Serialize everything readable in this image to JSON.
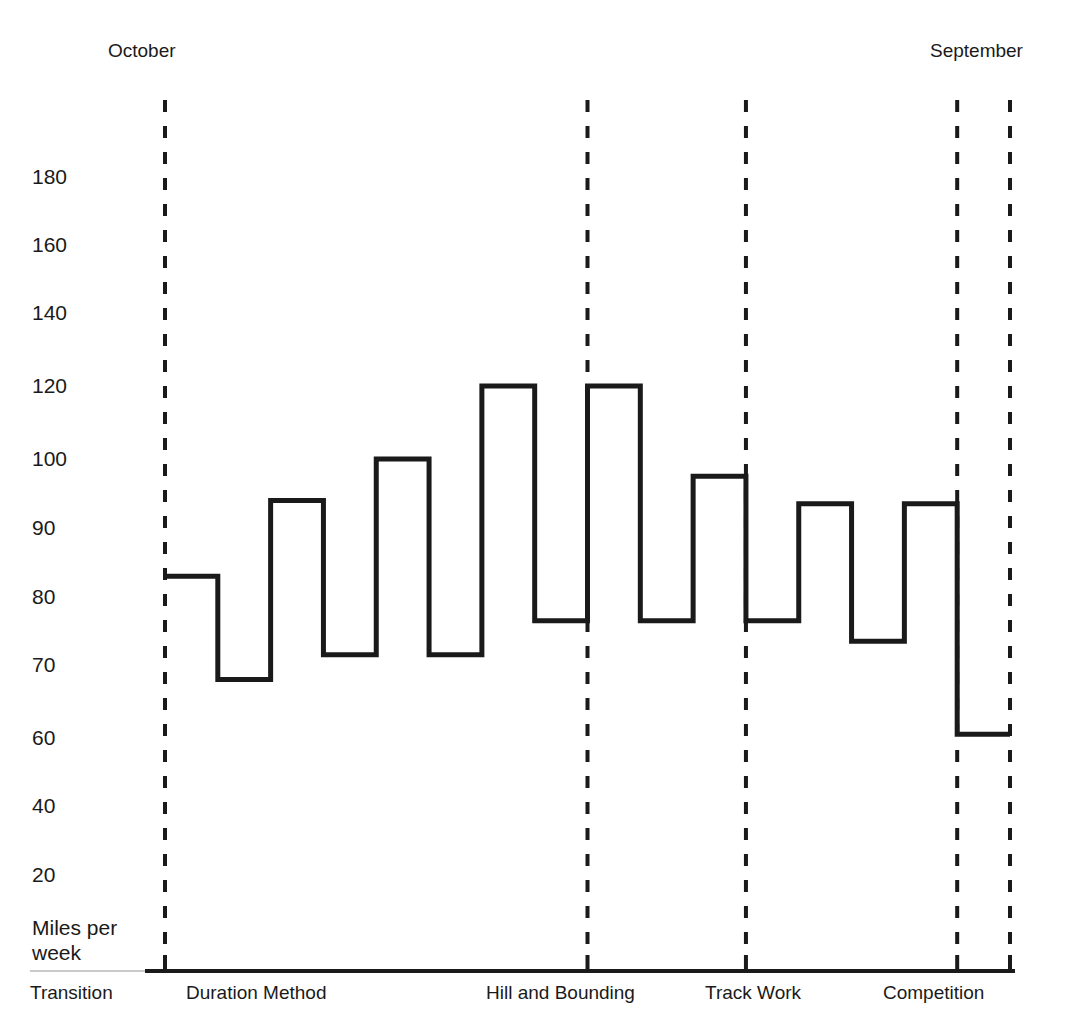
{
  "chart_data": {
    "type": "line",
    "title": "",
    "subtitle": "",
    "xlabel": "",
    "ylabel": "Miles per week",
    "step_style": "step-post",
    "grid": false,
    "legend": "none",
    "line_color": "#1a1a1a",
    "background_color": "#ffffff",
    "axis_color": "#1a1a1a",
    "divider_style": "dashed",
    "top_labels": [
      {
        "text": "October",
        "x_value": 0
      },
      {
        "text": "September",
        "x_value": 16
      }
    ],
    "y_tick_labels": [
      "180",
      "160",
      "140",
      "120",
      "100",
      "90",
      "80",
      "70",
      "60",
      "40",
      "20"
    ],
    "y_tick_values": [
      180,
      160,
      140,
      120,
      100,
      90,
      80,
      70,
      60,
      40,
      20
    ],
    "y_axis_note": "non-linear axis: 20-unit steps above 100, 10-unit steps between 60 and 100",
    "ylim": [
      20,
      180
    ],
    "x_axis_unit": "week",
    "xlim": [
      0,
      16
    ],
    "categories": [
      "1",
      "2",
      "3",
      "4",
      "5",
      "6",
      "7",
      "8",
      "9",
      "10",
      "11",
      "12",
      "13",
      "14",
      "15",
      "16"
    ],
    "values": [
      83,
      68,
      94,
      71.5,
      100,
      71.5,
      120,
      76.5,
      120,
      76.5,
      97.5,
      76.5,
      93.5,
      73.5,
      93.5,
      60.5
    ],
    "phases": [
      {
        "label": "Transition",
        "start_week": null,
        "end_week": 0,
        "label_x": 30
      },
      {
        "label": "Duration Method",
        "start_week": 0,
        "end_week": 8,
        "label_x": 186
      },
      {
        "label": "Hill and Bounding",
        "start_week": 8,
        "end_week": 11,
        "label_x": 486
      },
      {
        "label": "Track Work",
        "start_week": 11,
        "end_week": 15,
        "label_x": 705
      },
      {
        "label": "Competition",
        "start_week": 15,
        "end_week": 16,
        "label_x": 883
      }
    ],
    "phase_divider_weeks": [
      0,
      8,
      11,
      15,
      16
    ]
  }
}
